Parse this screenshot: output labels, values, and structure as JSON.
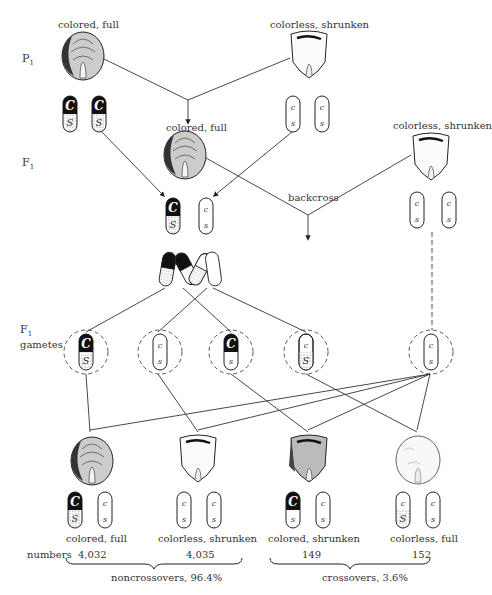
{
  "generations": {
    "p1": {
      "letter": "P",
      "sub": "1"
    },
    "f1": {
      "letter": "F",
      "sub": "1"
    },
    "f1_gametes": {
      "letter": "F",
      "sub": "1",
      "extra": "gametes"
    }
  },
  "parents": {
    "left_label": "colored, full",
    "right_label": "colorless, shrunken"
  },
  "f1": {
    "hybrid_label": "colored, full",
    "tester_label": "colorless, shrunken",
    "backcross_label": "backcross"
  },
  "alleles": {
    "C": "C",
    "c": "c",
    "S": "S",
    "s": "s"
  },
  "offspring": [
    {
      "label": "colored, full",
      "count": "4,032"
    },
    {
      "label": "colorless, shrunken",
      "count": "4,035"
    },
    {
      "label": "colored, shrunken",
      "count": "149"
    },
    {
      "label": "colorless, full",
      "count": "152"
    }
  ],
  "summary": {
    "numbers_label": "numbers",
    "noncrossovers": "noncrossovers, 96.4%",
    "crossovers": "crossovers, 3.6%"
  },
  "colors": {
    "ink": "#222222",
    "stipple": "#cfcfcf",
    "paper": "#ffffff"
  }
}
